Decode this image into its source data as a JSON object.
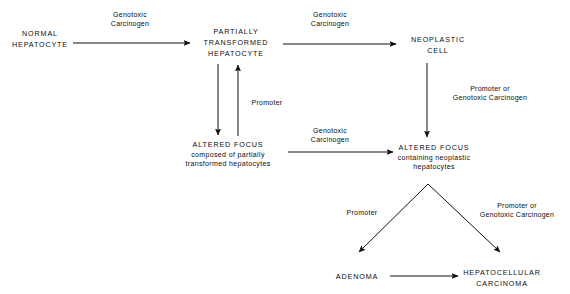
{
  "diagram": {
    "background_color": "#ffffff",
    "line_color": "#101010",
    "text_color": "#0d0d0d",
    "nodes": [
      {
        "id": "normal-hepatocyte",
        "lines": [
          "NORMAL",
          "HEPATOCYTE"
        ],
        "style": "caps"
      },
      {
        "id": "partially-transformed-hepatocyte",
        "lines": [
          "PARTIALLY",
          "TRANSFORMED",
          "HEPATOCYTE"
        ],
        "style": "caps"
      },
      {
        "id": "neoplastic-cell",
        "lines": [
          "NEOPLASTIC",
          "CELL"
        ],
        "style": "caps"
      },
      {
        "id": "altered-focus-partially-transformed",
        "lines": [
          "ALTERED FOCUS",
          "composed of partially",
          "transformed hepatocytes"
        ],
        "style": "caps-plus-sub"
      },
      {
        "id": "altered-focus-neoplastic",
        "lines": [
          "ALTERED FOCUS",
          "containing neoplastic",
          "hepatocytes"
        ],
        "style": "caps-plus-sub"
      },
      {
        "id": "adenoma",
        "lines": [
          "ADENOMA"
        ],
        "style": "caps"
      },
      {
        "id": "hepatocellular-carcinoma",
        "lines": [
          "HEPATOCELLULAR",
          "CARCINOMA"
        ],
        "style": "caps"
      }
    ],
    "edge_labels": [
      {
        "id": "label-genotoxic-carcinogen-1",
        "lines": [
          "Genotoxic",
          "Carcinogen"
        ],
        "from": "normal-hepatocyte",
        "to": "partially-transformed-hepatocyte"
      },
      {
        "id": "label-genotoxic-carcinogen-2",
        "lines": [
          "Genotoxic",
          "Carcinogen"
        ],
        "from": "partially-transformed-hepatocyte",
        "to": "neoplastic-cell"
      },
      {
        "id": "label-promoter-1",
        "lines": [
          "Promoter"
        ],
        "from": "altered-focus-partially-transformed",
        "to": "partially-transformed-hepatocyte"
      },
      {
        "id": "label-promoter-or-genotoxic-carcinogen-1",
        "lines": [
          "Promoter or",
          "Genotoxic Carcinogen"
        ],
        "from": "neoplastic-cell",
        "to": "altered-focus-neoplastic"
      },
      {
        "id": "label-genotoxic-carcinogen-3",
        "lines": [
          "Genotoxic",
          "Carcinogen"
        ],
        "from": "altered-focus-partially-transformed",
        "to": "altered-focus-neoplastic"
      },
      {
        "id": "label-promoter-2",
        "lines": [
          "Promoter"
        ],
        "from": "altered-focus-neoplastic",
        "to": "adenoma"
      },
      {
        "id": "label-promoter-or-genotoxic-carcinogen-2",
        "lines": [
          "Promoter or",
          "Genotoxic Carcinogen"
        ],
        "from": "altered-focus-neoplastic",
        "to": "hepatocellular-carcinoma"
      }
    ],
    "node_text": {
      "normal_1": "NORMAL",
      "normal_2": "HEPATOCYTE",
      "partial_1": "PARTIALLY",
      "partial_2": "TRANSFORMED",
      "partial_3": "HEPATOCYTE",
      "neoplastic_1": "NEOPLASTIC",
      "neoplastic_2": "CELL",
      "focus_a_1": "ALTERED FOCUS",
      "focus_a_2": "composed of partially",
      "focus_a_3": "transformed hepatocytes",
      "focus_b_1": "ALTERED FOCUS",
      "focus_b_2": "containing neoplastic",
      "focus_b_3": "hepatocytes",
      "adenoma_1": "ADENOMA",
      "hcc_1": "HEPATOCELLULAR",
      "hcc_2": "CARCINOMA"
    },
    "label_text": {
      "gen_1a": "Genotoxic",
      "gen_1b": "Carcinogen",
      "gen_2a": "Genotoxic",
      "gen_2b": "Carcinogen",
      "gen_3a": "Genotoxic",
      "gen_3b": "Carcinogen",
      "promoter_vertical": "Promoter",
      "promoter_fork": "Promoter",
      "pog_1a": "Promoter or",
      "pog_1b": "Genotoxic Carcinogen",
      "pog_2a": "Promoter or",
      "pog_2b": "Genotoxic Carcinogen"
    }
  }
}
